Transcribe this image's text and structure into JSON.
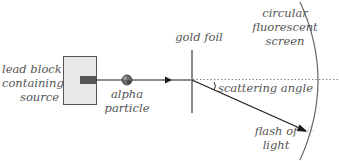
{
  "diagram": {
    "labels": {
      "lead_block": [
        "lead block",
        "containing",
        "source"
      ],
      "alpha_particle": [
        "alpha",
        "particle"
      ],
      "gold_foil": "gold foil",
      "screen": [
        "circular",
        "fluorescent",
        "screen"
      ],
      "scattering_angle": "scattering angle",
      "flash": [
        "flash of",
        "light"
      ]
    },
    "colors": {
      "block_fill": "#e8e8e8",
      "block_border": "#555555",
      "source_fill": "#555555",
      "beam": "#1a1a1a",
      "foil": "#8a8a8a",
      "screen_arc": "#666666",
      "dotted": "#888888",
      "text": "#555555"
    }
  }
}
